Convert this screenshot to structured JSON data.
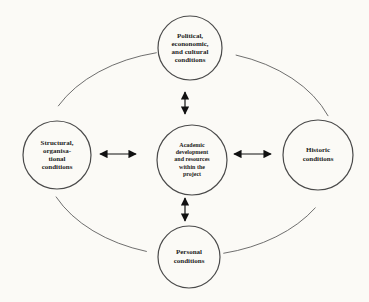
{
  "diagram": {
    "nodes": {
      "political": {
        "lines": [
          "Political,",
          "econonomic,",
          "and cultural",
          "conditions"
        ]
      },
      "structural": {
        "lines": [
          "Structural,",
          "organisa-",
          "tional",
          "conditions"
        ]
      },
      "academic": {
        "lines": [
          "Academic",
          "development",
          "and resources",
          "within the",
          "project"
        ]
      },
      "historic": {
        "lines": [
          "Historic",
          "conditions"
        ]
      },
      "personal": {
        "lines": [
          "Personal",
          "conditions"
        ]
      }
    },
    "arrows": [
      {
        "between": [
          "political",
          "academic"
        ],
        "style": "double-headed"
      },
      {
        "between": [
          "structural",
          "academic"
        ],
        "style": "double-headed"
      },
      {
        "between": [
          "historic",
          "academic"
        ],
        "style": "double-headed"
      },
      {
        "between": [
          "personal",
          "academic"
        ],
        "style": "double-headed"
      }
    ],
    "outer_ring": {
      "shape": "ellipse segments linking the four outer circles",
      "arrowheads": false
    },
    "colors": {
      "background": "#fbfaf6",
      "ink": "#1d1d1d",
      "circle_stroke": "#4a4a4a",
      "arc_stroke": "#5f5f5f",
      "arrow": "#111111"
    }
  }
}
